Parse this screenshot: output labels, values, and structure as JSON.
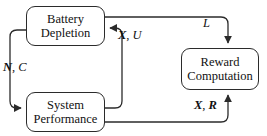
{
  "diagram": {
    "background_color": "#ffffff",
    "stroke_color": "#2b2b2b",
    "text_color": "#111111",
    "nodes": [
      {
        "id": "battery-depletion",
        "line1": "Battery",
        "line2": "Depletion",
        "x": 26,
        "y": 6,
        "width": 79,
        "height": 40
      },
      {
        "id": "system-performance",
        "line1": "System",
        "line2": "Performance",
        "x": 26,
        "y": 92,
        "width": 79,
        "height": 40
      },
      {
        "id": "reward-computation",
        "line1": "Reward",
        "line2": "Computation",
        "x": 181,
        "y": 48,
        "width": 78,
        "height": 42
      }
    ],
    "edges": [
      {
        "id": "battery-to-reward",
        "from": "battery-depletion",
        "to": "reward-computation",
        "label_symbols": [
          {
            "text": "L",
            "style": "italic"
          }
        ],
        "label_text": "L"
      },
      {
        "id": "battery-to-system",
        "from": "battery-depletion",
        "to": "system-performance",
        "label_symbols": [
          {
            "text": "N",
            "style": "bold-italic"
          },
          {
            "text": ", ",
            "style": "plain"
          },
          {
            "text": "C",
            "style": "italic"
          }
        ],
        "label_text": "N, C"
      },
      {
        "id": "system-to-battery",
        "from": "system-performance",
        "to": "battery-depletion",
        "label_symbols": [
          {
            "text": "X",
            "style": "bold-italic"
          },
          {
            "text": ", ",
            "style": "plain"
          },
          {
            "text": "U",
            "style": "italic"
          }
        ],
        "label_text": "X, U"
      },
      {
        "id": "system-to-reward",
        "from": "system-performance",
        "to": "reward-computation",
        "label_symbols": [
          {
            "text": "X",
            "style": "bold-italic"
          },
          {
            "text": ", ",
            "style": "plain"
          },
          {
            "text": "R",
            "style": "bold-italic"
          }
        ],
        "label_text": "X, R"
      }
    ]
  }
}
